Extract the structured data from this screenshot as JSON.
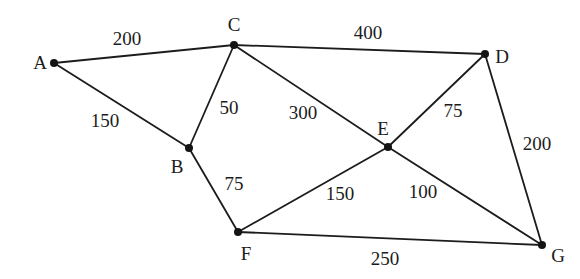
{
  "diagram": {
    "background_color": "#ffffff",
    "edge_color": "#1c1c1c",
    "node_color": "#141414",
    "text_color": "#1c1c1c",
    "node_radius": 4,
    "edge_stroke_width": 1.8,
    "node_label_font_size": 19,
    "weight_label_font_size": 19,
    "nodes": [
      {
        "id": "A",
        "x": 54,
        "y": 63,
        "label": "A",
        "label_x": 40,
        "label_y": 62
      },
      {
        "id": "B",
        "x": 189,
        "y": 148,
        "label": "B",
        "label_x": 177,
        "label_y": 166
      },
      {
        "id": "C",
        "x": 234,
        "y": 45,
        "label": "C",
        "label_x": 234,
        "label_y": 24
      },
      {
        "id": "D",
        "x": 485,
        "y": 54,
        "label": "D",
        "label_x": 502,
        "label_y": 56
      },
      {
        "id": "E",
        "x": 388,
        "y": 147,
        "label": "E",
        "label_x": 383,
        "label_y": 128
      },
      {
        "id": "F",
        "x": 238,
        "y": 232,
        "label": "F",
        "label_x": 246,
        "label_y": 253
      },
      {
        "id": "G",
        "x": 542,
        "y": 245,
        "label": "G",
        "label_x": 558,
        "label_y": 255
      }
    ],
    "edges": [
      {
        "from": "A",
        "to": "C",
        "weight": "200",
        "label_x": 127,
        "label_y": 38
      },
      {
        "from": "A",
        "to": "B",
        "weight": "150",
        "label_x": 105,
        "label_y": 120
      },
      {
        "from": "B",
        "to": "C",
        "weight": "50",
        "label_x": 229,
        "label_y": 107
      },
      {
        "from": "C",
        "to": "D",
        "weight": "400",
        "label_x": 368,
        "label_y": 32
      },
      {
        "from": "C",
        "to": "E",
        "weight": "300",
        "label_x": 303,
        "label_y": 112
      },
      {
        "from": "D",
        "to": "E",
        "weight": "75",
        "label_x": 453,
        "label_y": 110
      },
      {
        "from": "D",
        "to": "G",
        "weight": "200",
        "label_x": 537,
        "label_y": 143
      },
      {
        "from": "B",
        "to": "F",
        "weight": "75",
        "label_x": 234,
        "label_y": 183
      },
      {
        "from": "E",
        "to": "F",
        "weight": "150",
        "label_x": 340,
        "label_y": 193
      },
      {
        "from": "E",
        "to": "G",
        "weight": "100",
        "label_x": 423,
        "label_y": 191
      },
      {
        "from": "F",
        "to": "G",
        "weight": "250",
        "label_x": 385,
        "label_y": 258
      }
    ]
  }
}
